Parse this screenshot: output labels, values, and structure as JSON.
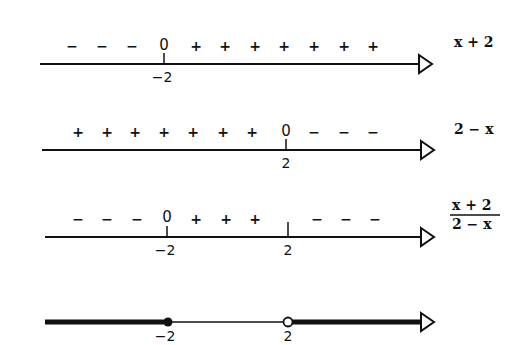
{
  "rows": [
    {
      "expression": "x + 2",
      "line_y": 64,
      "ticks": [
        {
          "x": 164,
          "label": "−2"
        }
      ],
      "zeros": [
        {
          "x": 164,
          "label": "0"
        }
      ],
      "signs": [
        {
          "x": 72,
          "s": "−"
        },
        {
          "x": 102,
          "s": "−"
        },
        {
          "x": 132,
          "s": "−"
        },
        {
          "x": 196,
          "s": "+"
        },
        {
          "x": 225,
          "s": "+"
        },
        {
          "x": 255,
          "s": "+"
        },
        {
          "x": 284,
          "s": "+"
        },
        {
          "x": 314,
          "s": "+"
        },
        {
          "x": 344,
          "s": "+"
        },
        {
          "x": 373,
          "s": "+"
        }
      ]
    },
    {
      "expression": "2 − x",
      "line_y": 150,
      "ticks": [
        {
          "x": 286,
          "label": "2"
        }
      ],
      "zeros": [
        {
          "x": 286,
          "label": "0"
        }
      ],
      "signs": [
        {
          "x": 78,
          "s": "+"
        },
        {
          "x": 107,
          "s": "+"
        },
        {
          "x": 135,
          "s": "+"
        },
        {
          "x": 164,
          "s": "+"
        },
        {
          "x": 193,
          "s": "+"
        },
        {
          "x": 223,
          "s": "+"
        },
        {
          "x": 252,
          "s": "+"
        },
        {
          "x": 314,
          "s": "−"
        },
        {
          "x": 344,
          "s": "−"
        },
        {
          "x": 373,
          "s": "−"
        }
      ]
    },
    {
      "expression_num": "x + 2",
      "expression_den": "2 − x",
      "line_y": 237,
      "ticks": [
        {
          "x": 167,
          "label": "−2"
        },
        {
          "x": 288,
          "label": "2"
        }
      ],
      "zeros": [
        {
          "x": 167,
          "label": "0"
        }
      ],
      "signs": [
        {
          "x": 78,
          "s": "−"
        },
        {
          "x": 107,
          "s": "−"
        },
        {
          "x": 137,
          "s": "−"
        },
        {
          "x": 196,
          "s": "+"
        },
        {
          "x": 226,
          "s": "+"
        },
        {
          "x": 255,
          "s": "+"
        },
        {
          "x": 317,
          "s": "−"
        },
        {
          "x": 346,
          "s": "−"
        },
        {
          "x": 375,
          "s": "−"
        }
      ]
    },
    {
      "line_y": 322,
      "ticks": [
        {
          "x": 168,
          "label": "−2"
        },
        {
          "x": 288,
          "label": "2"
        }
      ],
      "closed_point": {
        "x": 168
      },
      "open_point": {
        "x": 288
      }
    }
  ],
  "colors": {
    "ink": "#111111",
    "background": "#ffffff"
  }
}
